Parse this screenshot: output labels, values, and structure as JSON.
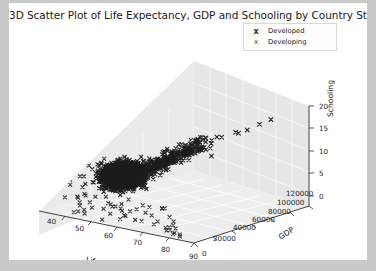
{
  "figure": {
    "title": "3D Scatter Plot of Life Expectancy, GDP and Schooling by Country Status",
    "background": "#ffffff",
    "page_background": "#c9c9c9"
  },
  "legend": {
    "entries": [
      {
        "label": "Developed",
        "marker": "x",
        "color": "#2b2b2b"
      },
      {
        "label": "Developing",
        "marker": "x",
        "color": "#4a4a4a"
      }
    ]
  },
  "axes": {
    "x": {
      "name": "Life Expectancy",
      "ticks": [
        "40",
        "50",
        "60",
        "70",
        "80",
        "90"
      ]
    },
    "y": {
      "name": "GDP",
      "ticks": [
        "0",
        "20000",
        "40000",
        "60000",
        "80000",
        "100000",
        "120000"
      ]
    },
    "z": {
      "name": "Schooling",
      "ticks": [
        "0",
        "5",
        "10",
        "15",
        "20"
      ]
    }
  },
  "chart_data": {
    "type": "scatter",
    "projection": "3d",
    "title": "3D Scatter Plot of Life Expectancy, GDP and Schooling by Country Status",
    "xlabel": "Life Expectancy",
    "ylabel": "GDP",
    "zlabel": "Schooling",
    "xlim": [
      35,
      95
    ],
    "ylim": [
      0,
      130000
    ],
    "zlim": [
      0,
      22
    ],
    "xticks": [
      40,
      50,
      60,
      70,
      80,
      90
    ],
    "yticks": [
      0,
      20000,
      40000,
      60000,
      80000,
      100000,
      120000
    ],
    "zticks": [
      0,
      5,
      10,
      15,
      20
    ],
    "grid": true,
    "legend_position": "upper right",
    "marker": "x",
    "series": [
      {
        "name": "Developed",
        "color": "#2b2b2b",
        "marker": "x",
        "points": [
          [
            78,
            42000,
            16.5
          ],
          [
            79,
            51000,
            17.2
          ],
          [
            80,
            38000,
            16.0
          ],
          [
            81,
            46000,
            17.8
          ],
          [
            82,
            57000,
            18.1
          ],
          [
            80,
            62000,
            16.9
          ],
          [
            77,
            35000,
            15.4
          ],
          [
            83,
            74000,
            18.4
          ],
          [
            79,
            88000,
            17.0
          ],
          [
            81,
            101000,
            17.6
          ],
          [
            82,
            119000,
            18.0
          ],
          [
            78,
            28000,
            15.1
          ],
          [
            80,
            24000,
            16.2
          ],
          [
            76,
            19000,
            14.8
          ],
          [
            84,
            48000,
            18.6
          ],
          [
            83,
            41000,
            17.4
          ],
          [
            81,
            33000,
            16.4
          ],
          [
            79,
            66000,
            16.8
          ],
          [
            77,
            55000,
            15.6
          ],
          [
            82,
            95000,
            17.9
          ],
          [
            80,
            110000,
            17.1
          ],
          [
            75,
            16000,
            14.2
          ],
          [
            74,
            13000,
            13.8
          ],
          [
            78,
            22000,
            15.9
          ],
          [
            83,
            58000,
            18.2
          ],
          [
            81,
            70000,
            17.3
          ],
          [
            79,
            31000,
            16.1
          ],
          [
            76,
            26000,
            14.6
          ],
          [
            82,
            45000,
            17.7
          ],
          [
            80,
            36000,
            16.6
          ]
        ]
      },
      {
        "name": "Developing",
        "color": "#3a3a3a",
        "marker": "x",
        "points": [
          [
            52,
            800,
            7.5
          ],
          [
            55,
            1200,
            8.1
          ],
          [
            58,
            1600,
            9.0
          ],
          [
            60,
            2100,
            9.6
          ],
          [
            62,
            2600,
            10.2
          ],
          [
            64,
            3100,
            10.8
          ],
          [
            66,
            3800,
            11.3
          ],
          [
            68,
            4500,
            11.9
          ],
          [
            70,
            5400,
            12.4
          ],
          [
            71,
            6200,
            12.8
          ],
          [
            72,
            7100,
            13.1
          ],
          [
            73,
            8400,
            13.5
          ],
          [
            74,
            9800,
            13.9
          ],
          [
            75,
            11500,
            14.2
          ],
          [
            69,
            4900,
            12.2
          ],
          [
            67,
            4100,
            11.6
          ],
          [
            65,
            3400,
            11.0
          ],
          [
            63,
            2800,
            10.5
          ],
          [
            61,
            2300,
            9.9
          ],
          [
            59,
            1900,
            9.3
          ],
          [
            57,
            1400,
            8.6
          ],
          [
            54,
            1000,
            7.9
          ],
          [
            51,
            700,
            7.1
          ],
          [
            48,
            550,
            6.4
          ],
          [
            45,
            420,
            5.8
          ],
          [
            43,
            360,
            5.2
          ],
          [
            41,
            300,
            4.6
          ],
          [
            46,
            480,
            6.0
          ],
          [
            49,
            620,
            6.8
          ],
          [
            53,
            900,
            7.7
          ],
          [
            56,
            1300,
            8.4
          ],
          [
            76,
            13500,
            14.6
          ],
          [
            77,
            15800,
            14.9
          ],
          [
            70,
            5900,
            12.6
          ],
          [
            66,
            3600,
            11.2
          ],
          [
            62,
            2500,
            10.1
          ],
          [
            58,
            1700,
            8.9
          ],
          [
            50,
            660,
            6.9
          ],
          [
            44,
            390,
            5.5
          ],
          [
            42,
            330,
            4.9
          ]
        ]
      }
    ]
  }
}
